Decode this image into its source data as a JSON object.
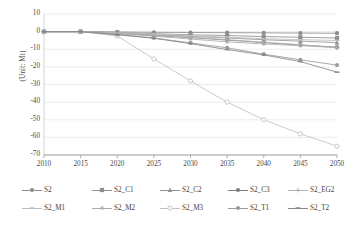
{
  "chart_data": {
    "type": "line",
    "title": "",
    "subtitle": "",
    "xlabel": "",
    "ylabel": "(Unit: Mt)",
    "x": [
      2010,
      2015,
      2020,
      2025,
      2030,
      2035,
      2040,
      2045,
      2050
    ],
    "xtick_labels": [
      "2010",
      "2015",
      "2020",
      "2025",
      "2030",
      "2035",
      "2040",
      "2045",
      "2050"
    ],
    "ytick_labels": [
      "10",
      "0",
      "-10",
      "-20",
      "-30",
      "-40",
      "-50",
      "-60",
      "-70"
    ],
    "yticks": [
      10,
      0,
      -10,
      -20,
      -30,
      -40,
      -50,
      -60,
      -70
    ],
    "xlim": [
      2010,
      2050
    ],
    "ylim": [
      -70,
      10
    ],
    "grid": "horizontal",
    "legend_position": "bottom",
    "series": [
      {
        "name": "S2",
        "color": "#8c8c8c",
        "marker": "circle",
        "values": [
          0,
          0,
          -0.2,
          -0.4,
          -0.5,
          -0.6,
          -0.7,
          -0.8,
          -0.9
        ]
      },
      {
        "name": "S2_C1",
        "color": "#8f8f8f",
        "marker": "square",
        "values": [
          0,
          0,
          -0.5,
          -1.2,
          -1.8,
          -2.2,
          -2.8,
          -3.2,
          -3.6
        ]
      },
      {
        "name": "S2_C2",
        "color": "#949494",
        "marker": "triangle",
        "values": [
          0,
          0,
          -0.8,
          -1.8,
          -2.6,
          -3.6,
          -4.6,
          -5.4,
          -6.2
        ]
      },
      {
        "name": "S2_C3",
        "color": "#7d7d7d",
        "marker": "circle",
        "values": [
          0,
          0,
          -1.0,
          -2.2,
          -3.4,
          -4.8,
          -6.2,
          -7.6,
          -8.8
        ]
      },
      {
        "name": "S2_EG2",
        "color": "#b3b3b3",
        "marker": "plus",
        "values": [
          0,
          0,
          -0.9,
          -2.0,
          -3.2,
          -4.6,
          -6.0,
          -7.4,
          -9.2
        ]
      },
      {
        "name": "S2_M1",
        "color": "#bdbdbd",
        "marker": "dash",
        "values": [
          0,
          0,
          -0.6,
          -1.4,
          -2.4,
          -3.2,
          -4.0,
          -4.6,
          -5.0
        ]
      },
      {
        "name": "S2_M2",
        "color": "#ababab",
        "marker": "star",
        "values": [
          0,
          0,
          -1.2,
          -2.6,
          -4.2,
          -5.8,
          -7.0,
          -8.0,
          -9.0
        ]
      },
      {
        "name": "S2_M3",
        "color": "#c2c2c2",
        "marker": "circle-open",
        "values": [
          0,
          0,
          -2.5,
          -15.5,
          -28.0,
          -40.0,
          -50.0,
          -58.0,
          -65.0
        ]
      },
      {
        "name": "S2_T1",
        "color": "#9a9a9a",
        "marker": "circle",
        "values": [
          0,
          0,
          -1.6,
          -3.6,
          -6.4,
          -9.2,
          -12.8,
          -16.0,
          -19.0
        ]
      },
      {
        "name": "S2_T2",
        "color": "#868686",
        "marker": "dash",
        "values": [
          0,
          0,
          -1.8,
          -3.8,
          -6.8,
          -10.2,
          -13.2,
          -17.0,
          -23.0
        ]
      }
    ]
  },
  "legend": {
    "row1": [
      "S2",
      "S2_C1",
      "S2_C2",
      "S2_C3",
      "S2_EG2"
    ],
    "row2": [
      "S2_M1",
      "S2_M2",
      "S2_M3",
      "S2_T1",
      "S2_T2"
    ]
  },
  "axes": {
    "y_title": "(Unit: Mt)"
  }
}
